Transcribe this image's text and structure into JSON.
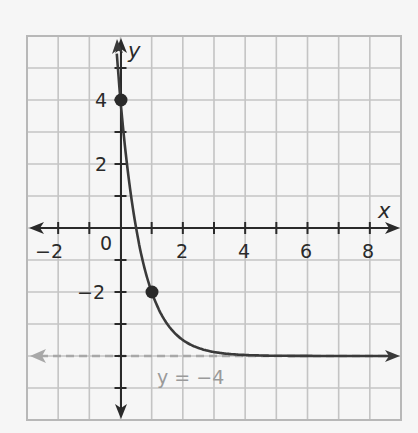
{
  "chart_data": {
    "type": "line",
    "title": "",
    "xlabel": "x",
    "ylabel": "y",
    "xlim": [
      -3,
      9
    ],
    "ylim": [
      -6,
      6
    ],
    "grid": true,
    "grid_step": 1,
    "x_ticks": [
      -2,
      0,
      2,
      4,
      6,
      8
    ],
    "x_tick_labels": [
      "−2",
      "0",
      "2",
      "4",
      "6",
      "8"
    ],
    "y_ticks": [
      4,
      2,
      -2
    ],
    "y_tick_labels": [
      "4",
      "2",
      "−2"
    ],
    "series": [
      {
        "name": "exponential curve",
        "function": "y = 8(1/4)^x - 4",
        "color": "#3a3a3a",
        "x": [
          -0.25,
          0,
          0.5,
          1,
          1.5,
          2,
          3,
          4,
          6,
          8,
          9
        ],
        "y": [
          7.31,
          4,
          0,
          -2,
          -3,
          -3.5,
          -3.875,
          -3.97,
          -4.0,
          -4.0,
          -4.0
        ],
        "marked_points": [
          {
            "x": 0,
            "y": 4
          },
          {
            "x": 1,
            "y": -2
          }
        ]
      },
      {
        "name": "asymptote",
        "style": "dashed",
        "color": "#a0a0a0",
        "x": [
          -3,
          9
        ],
        "y": [
          -4,
          -4
        ]
      }
    ],
    "annotations": [
      {
        "text": "y = −4",
        "x": 1.1,
        "y": -4.7,
        "color": "#9a9a9a"
      }
    ]
  },
  "labels": {
    "x_axis": "x",
    "y_axis": "y",
    "asymptote": "y = −4",
    "xt_m2": "−2",
    "xt_0": "0",
    "xt_2": "2",
    "xt_4": "4",
    "xt_6": "6",
    "xt_8": "8",
    "yt_4": "4",
    "yt_2": "2",
    "yt_m2": "−2"
  }
}
